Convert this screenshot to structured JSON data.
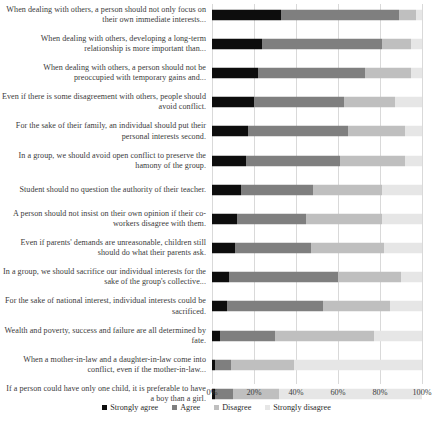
{
  "chart_data": {
    "type": "bar",
    "subtype": "stacked-horizontal-100",
    "title": "",
    "xlabel": "",
    "ylabel": "",
    "xlim": [
      0,
      100
    ],
    "grid": true,
    "legend_position": "bottom",
    "tick_labels": [
      "0%",
      "20%",
      "40%",
      "60%",
      "80%",
      "100%"
    ],
    "tick_values": [
      0,
      20,
      40,
      60,
      80,
      100
    ],
    "legend": [
      "Strongly agree",
      "Agree",
      "Disagree",
      "Strongly disagree"
    ],
    "colors": {
      "Strongly agree": "#0d0d0d",
      "Agree": "#7f7f7f",
      "Disagree": "#bfbfbf",
      "Strongly disagree": "#e6e6e6"
    },
    "categories": [
      "When dealing with others, a person should not only focus on their own immediate interests...",
      "When dealing with others, developing a long-term relationship is more important than...",
      "When dealing with others, a person should not be preoccupied with temporary gains and...",
      "Even if there is some disagreement with others, people should avoid conflict.",
      "For the sake of their family, an individual should put their personal interests second.",
      "In a group, we should avoid open conflict to preserve the hamony of the group.",
      "Student should no question the authority of their teacher.",
      "A person should not insist on their own opinion if their co-workers disagree with them.",
      "Even if parents' demands are unreasonable, children still should do what their parents ask.",
      "In a group, we should sacrifice our individual interests for the sake of the group's collective...",
      "For the sake of national interest, individual interests could be sacrificed.",
      "Wealth and poverty, success and failure are all determined by fate.",
      "When a mother-in-law and a daughter-in-law come into conflict, even if the mother-in-law...",
      "If a person could have only one child, it is preferable to have a boy than a girl."
    ],
    "series": [
      {
        "name": "Strongly agree",
        "values": [
          33,
          24,
          22,
          20,
          17,
          16,
          14,
          12,
          11,
          8,
          7,
          4,
          1.5,
          1.5
        ]
      },
      {
        "name": "Agree",
        "values": [
          56,
          57,
          51,
          43,
          48,
          45,
          34,
          33,
          36,
          52,
          46,
          26,
          7.5,
          8.5
        ]
      },
      {
        "name": "Disagree",
        "values": [
          8,
          14,
          22,
          24,
          27,
          31,
          33,
          36,
          35,
          30,
          32,
          47,
          30,
          22
        ]
      },
      {
        "name": "Strongly disagree",
        "values": [
          3,
          5,
          5,
          13,
          8,
          8,
          19,
          19,
          18,
          10,
          15,
          23,
          61,
          68
        ]
      }
    ]
  }
}
